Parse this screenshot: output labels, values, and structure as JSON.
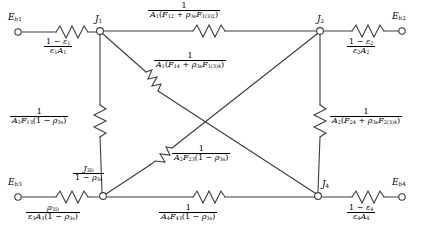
{
  "figure": {
    "kind": "radiation-network-diagram",
    "stroke_color": "#3c3c3c",
    "text_color": "#000000",
    "background": "#ffffff"
  },
  "terminals": [
    {
      "id": "eb1",
      "label_base": "E",
      "label_sub": "b₁",
      "x": 16,
      "y": 32
    },
    {
      "id": "eb2",
      "label_base": "E",
      "label_sub": "b₂",
      "x": 405,
      "y": 32
    },
    {
      "id": "eb3",
      "label_base": "E",
      "label_sub": "b₃",
      "x": 16,
      "y": 197
    },
    {
      "id": "eb4",
      "label_base": "E",
      "label_sub": "b₄",
      "x": 405,
      "y": 197
    }
  ],
  "junctions": [
    {
      "id": "j1",
      "label_base": "J",
      "label_sub": "1",
      "x": 100,
      "y": 31
    },
    {
      "id": "j2",
      "label_base": "J",
      "label_sub": "2",
      "x": 320,
      "y": 31
    },
    {
      "id": "j3",
      "label_base": "J",
      "label_sub": "3D",
      "x": 103,
      "y": 196,
      "node_label_num": "J",
      "node_label_num_sub": "3D",
      "node_label_den": "1 − ρ",
      "node_label_den_sub": "3s"
    },
    {
      "id": "j4",
      "label_base": "J",
      "label_sub": "4",
      "x": 318,
      "y": 196
    }
  ],
  "resistors": [
    {
      "id": "r-eb1-j1",
      "num": "1 − ε₁",
      "den": "ε₁A₁",
      "orientation": "horizontal"
    },
    {
      "id": "r-j1-j2",
      "num": "1",
      "den": "A₁(F₁₂ + ρ₃ₛF₁(₃)₂)",
      "orientation": "horizontal"
    },
    {
      "id": "r-j2-eb2",
      "num": "1 − ε₂",
      "den": "ε₂A₂",
      "orientation": "horizontal"
    },
    {
      "id": "r-j1-j4",
      "num": "1",
      "den": "A₁(F₁₄ + ρ₃ₛF₁(₃)₄)",
      "orientation": "diagonal"
    },
    {
      "id": "r-j1-j3",
      "num": "1",
      "den": "A₁F₁₃(1 − ρ₃ₛ)",
      "orientation": "vertical"
    },
    {
      "id": "r-j2-j4",
      "num": "1",
      "den": "A₂(F₂₄ + ρ₃ₛF₂(₃)₄)",
      "orientation": "vertical"
    },
    {
      "id": "r-j2-j3",
      "num": "1",
      "den": "A₂F₂₃(1 − ρ₃ₛ)",
      "orientation": "diagonal"
    },
    {
      "id": "r-eb3-j3",
      "num": "ρ₃ₔ",
      "den": "ε₃A₃(1 − ρ₃ₛ)",
      "orientation": "horizontal"
    },
    {
      "id": "r-j3-j4",
      "num": "1",
      "den": "A₄F₄₃(1 − ρ₃ₛ)",
      "orientation": "horizontal"
    },
    {
      "id": "r-j4-eb4",
      "num": "1 − ε₄",
      "den": "ε₄A₄",
      "orientation": "horizontal"
    }
  ],
  "labels": {
    "r_eb1_j1_num": "1 − ε",
    "r_eb1_j1_num_sub": "1",
    "r_eb1_j1_den": "ε",
    "r_eb1_j1_den_sub": "1",
    "r_eb1_j1_den2": "A",
    "r_eb1_j1_den2_sub": "1",
    "r_j2_eb2_num": "1 − ε",
    "r_j2_eb2_num_sub": "2",
    "r_j2_eb2_den": "ε",
    "r_j2_eb2_den_sub": "2",
    "r_j2_eb2_den2": "A",
    "r_j2_eb2_den2_sub": "2",
    "r_j4_eb4_num": "1 − ε",
    "r_j4_eb4_num_sub": "4",
    "r_j4_eb4_den": "ε",
    "r_j4_eb4_den_sub": "4",
    "r_j4_eb4_den2": "A",
    "r_j4_eb4_den2_sub": "4",
    "one": "1"
  }
}
